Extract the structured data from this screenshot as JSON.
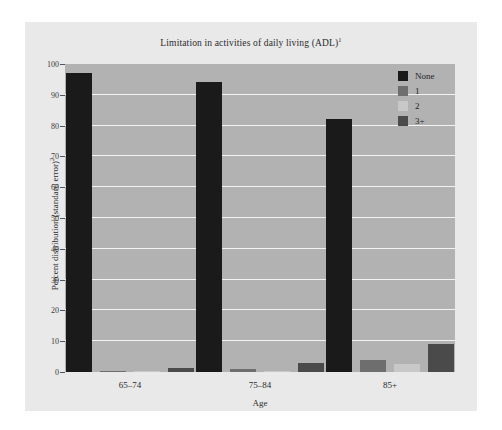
{
  "chart_data": {
    "type": "bar",
    "title": "Limitation in activities of daily living (ADL)",
    "title_superscript": "1",
    "xlabel": "Age",
    "ylabel": "Percent distribution (standard error)",
    "ylabel_superscript": "2",
    "categories": [
      "65–74",
      "75–84",
      "85+"
    ],
    "ylim": [
      0,
      100
    ],
    "yticks": [
      0,
      10,
      20,
      30,
      40,
      50,
      60,
      70,
      80,
      90,
      100
    ],
    "ytick_labels": [
      "0",
      "10",
      "20",
      "30",
      "40",
      "50",
      "60",
      "70",
      "80",
      "90",
      "100"
    ],
    "grid": true,
    "grid_color": "#f2f2f2",
    "legend_position": "top-right",
    "series": [
      {
        "name": "None",
        "color": "#1a1a1a",
        "values": [
          97.0,
          94.0,
          82.0
        ]
      },
      {
        "name": "1",
        "color": "#6e6e6e",
        "values": [
          0.4,
          0.9,
          4.0
        ]
      },
      {
        "name": "2",
        "color": "#c8c8c8",
        "values": [
          0.3,
          0.4,
          2.5
        ]
      },
      {
        "name": "3+",
        "color": "#4a4a4a",
        "values": [
          1.2,
          2.8,
          9.0
        ]
      }
    ],
    "plot_bg": "#b2b2b2",
    "figure_bg": "#e9e9e9",
    "page_bg": "#ffffff"
  },
  "legend": {
    "items": [
      {
        "label": "None",
        "color": "#1a1a1a"
      },
      {
        "label": "1",
        "color": "#6e6e6e"
      },
      {
        "label": "2",
        "color": "#c8c8c8"
      },
      {
        "label": "3+",
        "color": "#4a4a4a"
      }
    ]
  }
}
